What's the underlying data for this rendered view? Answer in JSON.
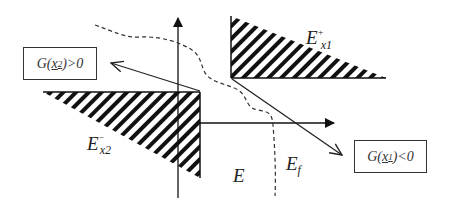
{
  "diagram": {
    "labels": {
      "e_x1_plus": {
        "base": "E",
        "sup": "+",
        "sub": "x1"
      },
      "e_x2_minus": {
        "base": "E",
        "sup": "−",
        "sub": "x2"
      },
      "e": "E",
      "e_f": {
        "base": "E",
        "sub": "f"
      }
    },
    "boxes": {
      "g_x2": {
        "prefix": "G(",
        "var": "x",
        "var_sub": "2",
        "suffix": ")>0"
      },
      "g_x1": {
        "prefix": "G(",
        "var": "x",
        "var_sub": "1",
        "suffix": ")<0"
      }
    },
    "colors": {
      "ink": "#222222",
      "box_border": "#333333",
      "background": "#ffffff"
    }
  }
}
